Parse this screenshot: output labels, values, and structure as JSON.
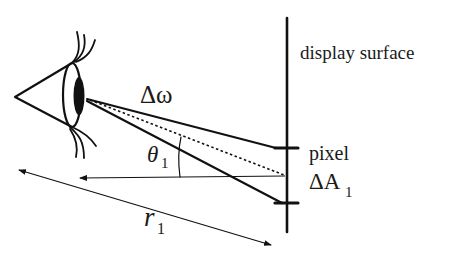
{
  "diagram": {
    "labels": {
      "display_surface": "display surface",
      "solid_angle": "Δω",
      "angle_symbol": "θ",
      "angle_subscript": "1",
      "pixel": "pixel",
      "area_symbol": "ΔA",
      "area_subscript": "1",
      "distance_symbol": "r",
      "distance_subscript": "1"
    },
    "colors": {
      "ink": "#111111",
      "background": "#ffffff"
    },
    "elements": [
      {
        "name": "eye",
        "type": "icon"
      },
      {
        "name": "display-surface-line",
        "type": "vertical-line"
      },
      {
        "name": "pixel-bounds",
        "type": "tick-marks",
        "count": 2
      },
      {
        "name": "solid-angle-rays",
        "type": "lines",
        "count": 2
      },
      {
        "name": "center-ray",
        "type": "dotted-line"
      },
      {
        "name": "normal-arrow",
        "type": "arrow"
      },
      {
        "name": "distance-arrow",
        "type": "double-arrow"
      }
    ]
  }
}
